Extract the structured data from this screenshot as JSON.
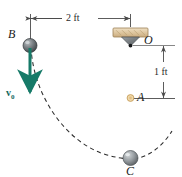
{
  "figure": {
    "type": "mechanics-pendulum-diagram",
    "background": "#ffffff",
    "width": 182,
    "height": 177,
    "colors": {
      "cord": "#5aa7dd",
      "ball": "#8a8f93",
      "ball_dark": "#4f5356",
      "support_block": "#e0cba8",
      "pivot": "#6f7477",
      "peg": "#e8c98a",
      "velocity_arrow": "#167a68",
      "dimension_line": "#4a4a4a",
      "path_dashed": "#2b2b2b",
      "label_text": "#1a1a1a"
    }
  },
  "labels": {
    "point_b": "B",
    "point_o": "O",
    "point_a": "A",
    "point_c": "C",
    "velocity": "v",
    "velocity_sub": "0"
  },
  "dimensions": {
    "horizontal": {
      "value": "2 ft",
      "from": "B",
      "to": "O",
      "orientation": "horizontal"
    },
    "vertical": {
      "value": "1 ft",
      "from": "O",
      "to": "A",
      "orientation": "vertical"
    }
  },
  "geometry": {
    "b": {
      "x": 30,
      "y": 45
    },
    "o": {
      "x": 130,
      "y": 45
    },
    "a": {
      "x": 130,
      "y": 98
    },
    "c": {
      "x": 130,
      "y": 158
    }
  },
  "elements": {
    "support_name": "pin-support-block",
    "pivot_name": "pivot-triangle",
    "cord_top_name": "cord-segment-bo",
    "cord_vertical_name": "cord-segment-oc",
    "path_name": "swing-path-arc",
    "peg_name": "peg-a",
    "ball_b_name": "ball-b",
    "ball_c_name": "ball-c",
    "velocity_arrow_name": "velocity-vector-v0"
  }
}
